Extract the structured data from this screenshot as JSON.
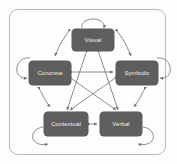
{
  "diagram": {
    "frame": {
      "name": "outer-border"
    },
    "colors": {
      "node_fill": "#5e5e5e",
      "node_text": "#f2f2f2",
      "arrow": "#6f6f6f",
      "border": "#b9b9b9",
      "background": "#fefefe"
    },
    "nodes": [
      {
        "id": "visual",
        "label": "Visual",
        "position": "top"
      },
      {
        "id": "concrete",
        "label": "Concrete",
        "position": "upper-left"
      },
      {
        "id": "symbolic",
        "label": "Symbolic",
        "position": "upper-right"
      },
      {
        "id": "contextual",
        "label": "Contextual",
        "position": "lower-left"
      },
      {
        "id": "verbal",
        "label": "Verbal",
        "position": "lower-right"
      }
    ],
    "self_loops": [
      {
        "node": "visual",
        "side": "top"
      },
      {
        "node": "concrete",
        "side": "left"
      },
      {
        "node": "symbolic",
        "side": "right"
      },
      {
        "node": "contextual",
        "side": "bottom-left"
      },
      {
        "node": "verbal",
        "side": "bottom-right"
      }
    ],
    "edges": [
      {
        "from": "visual",
        "to": "concrete",
        "style": "double-arrow",
        "ring": "outer"
      },
      {
        "from": "visual",
        "to": "symbolic",
        "style": "double-arrow",
        "ring": "outer"
      },
      {
        "from": "concrete",
        "to": "contextual",
        "style": "double-arrow",
        "ring": "outer"
      },
      {
        "from": "symbolic",
        "to": "verbal",
        "style": "double-arrow",
        "ring": "outer"
      },
      {
        "from": "contextual",
        "to": "verbal",
        "style": "double-arrow",
        "ring": "outer"
      },
      {
        "from": "concrete",
        "to": "symbolic",
        "style": "double-arrow",
        "ring": "inner"
      },
      {
        "from": "visual",
        "to": "contextual",
        "style": "double-arrow",
        "ring": "inner"
      },
      {
        "from": "visual",
        "to": "verbal",
        "style": "double-arrow",
        "ring": "inner"
      },
      {
        "from": "concrete",
        "to": "verbal",
        "style": "double-arrow",
        "ring": "inner"
      },
      {
        "from": "symbolic",
        "to": "contextual",
        "style": "double-arrow",
        "ring": "inner"
      }
    ]
  }
}
